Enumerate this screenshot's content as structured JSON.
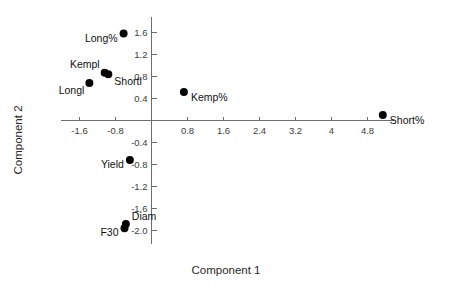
{
  "chart_data": {
    "type": "scatter",
    "title": "",
    "xlabel": "Component 1",
    "ylabel": "Component 2",
    "xlim": [
      -2.2,
      5.6
    ],
    "ylim": [
      -2.2,
      1.85
    ],
    "grid": false,
    "legend": "none",
    "xticks": [
      "-1.6",
      "-0.8",
      "0.8",
      "1.6",
      "2.4",
      "3.2",
      "4",
      "4.8"
    ],
    "xtick_values": [
      -1.6,
      -0.8,
      0.8,
      1.6,
      2.4,
      3.2,
      4.0,
      4.8
    ],
    "yticks": [
      "1.6",
      "1.2",
      "0.8",
      "0.4",
      "-0.4",
      "-0.8",
      "-1.2",
      "-1.6",
      "-2.0"
    ],
    "ytick_values": [
      1.6,
      1.2,
      0.8,
      0.4,
      -0.4,
      -0.8,
      -1.2,
      -1.6,
      -2.0
    ],
    "point_color": "#050505",
    "axis_color": "#6d6d6d",
    "points": [
      {
        "label": "Long%",
        "x": -0.62,
        "y": 1.58,
        "label_pos": "left"
      },
      {
        "label": "Kempl",
        "x": -1.04,
        "y": 0.87,
        "label_pos": "upleft"
      },
      {
        "label": "Shortl",
        "x": -0.96,
        "y": 0.84,
        "label_pos": "right-below"
      },
      {
        "label": "Longl",
        "x": -1.38,
        "y": 0.68,
        "label_pos": "left-below"
      },
      {
        "label": "Kemp%",
        "x": 0.72,
        "y": 0.52,
        "label_pos": "right"
      },
      {
        "label": "Short%",
        "x": 5.14,
        "y": 0.1,
        "label_pos": "right"
      },
      {
        "label": "Yield",
        "x": -0.48,
        "y": -0.72,
        "label_pos": "left"
      },
      {
        "label": "Diam",
        "x": -0.57,
        "y": -1.88,
        "label_pos": "upright"
      },
      {
        "label": "F30",
        "x": -0.6,
        "y": -1.96,
        "label_pos": "left"
      }
    ]
  }
}
